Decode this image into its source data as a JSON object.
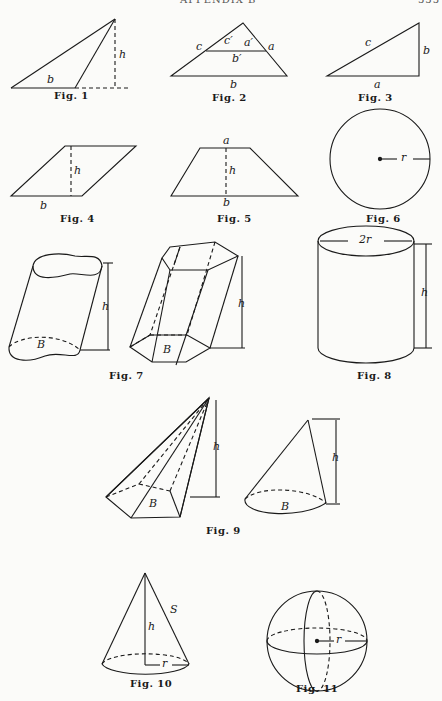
{
  "header": {
    "title": "APPENDIX B",
    "page_number": "555"
  },
  "figures": [
    {
      "id": "fig1",
      "caption": "Fig. 1",
      "labels": {
        "base": "b",
        "height": "h"
      }
    },
    {
      "id": "fig2",
      "caption": "Fig. 2",
      "labels": {
        "c": "c",
        "c_prime": "c′",
        "a_prime": "a′",
        "a": "a",
        "b_prime": "b′",
        "b": "b"
      }
    },
    {
      "id": "fig3",
      "caption": "Fig. 3",
      "labels": {
        "c": "c",
        "b": "b",
        "a": "a"
      }
    },
    {
      "id": "fig4",
      "caption": "Fig. 4",
      "labels": {
        "h": "h",
        "b": "b"
      }
    },
    {
      "id": "fig5",
      "caption": "Fig. 5",
      "labels": {
        "a": "a",
        "h": "h",
        "b": "b"
      }
    },
    {
      "id": "fig6",
      "caption": "Fig. 6",
      "labels": {
        "r": "r"
      }
    },
    {
      "id": "fig7",
      "caption": "Fig. 7",
      "labels": {
        "h1": "h",
        "B1": "B",
        "h2": "h",
        "B2": "B"
      }
    },
    {
      "id": "fig8",
      "caption": "Fig. 8",
      "labels": {
        "diameter": "2r",
        "h": "h"
      }
    },
    {
      "id": "fig9",
      "caption": "Fig. 9",
      "labels": {
        "h1": "h",
        "B1": "B",
        "h2": "h",
        "B2": "B"
      }
    },
    {
      "id": "fig10",
      "caption": "Fig. 10",
      "labels": {
        "h": "h",
        "S": "S",
        "r": "r"
      }
    },
    {
      "id": "fig11",
      "caption": "Fig. 11",
      "labels": {
        "r": "r"
      }
    }
  ]
}
